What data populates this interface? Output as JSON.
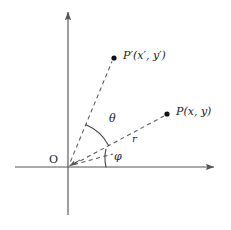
{
  "figure": {
    "type": "geometry-diagram",
    "background_color": "#ffffff",
    "stroke_color": "#555555",
    "text_color": "#1b1b1b",
    "width": 231,
    "height": 230
  },
  "axes": {
    "origin": {
      "x": 68,
      "y": 167,
      "label": "O"
    },
    "x_axis": {
      "name": "horizontal-axis",
      "from_x": 15,
      "to_x": 219,
      "y": 167,
      "arrow": "right"
    },
    "y_axis": {
      "name": "vertical-axis",
      "x": 68,
      "from_y": 215,
      "to_y": 7,
      "arrow": "up"
    }
  },
  "points": [
    {
      "id": "p-prime",
      "dot_x": 114,
      "dot_y": 58,
      "label": "P′(x′, y′)",
      "label_x": 124,
      "label_y": 51,
      "name": "point-p-prime"
    },
    {
      "id": "p",
      "dot_x": 167,
      "dot_y": 114,
      "label": "P(x, y)",
      "label_x": 177,
      "label_y": 107,
      "name": "point-p"
    }
  ],
  "rays": [
    {
      "id": "ray-to-p-prime",
      "from": [
        68,
        167
      ],
      "to": [
        112,
        61
      ],
      "style": "dashed"
    },
    {
      "id": "ray-to-p",
      "from": [
        68,
        167
      ],
      "to": [
        164,
        116
      ],
      "style": "dashed"
    },
    {
      "id": "baseline-segment",
      "from": [
        68,
        167
      ],
      "to": [
        112,
        155
      ],
      "style": "dashed"
    }
  ],
  "angles": [
    {
      "id": "theta",
      "label": "θ",
      "label_x": 109,
      "label_y": 114,
      "radius": 46,
      "start_deg": 28,
      "end_deg": 67,
      "name": "angle-theta"
    },
    {
      "id": "phi",
      "label": "φ",
      "label_x": 114,
      "label_y": 152,
      "radius": 38,
      "start_deg": 0,
      "end_deg": 28,
      "name": "angle-phi"
    }
  ],
  "segment_labels": [
    {
      "id": "radius-r",
      "label": "r",
      "label_x": 133,
      "label_y": 135,
      "name": "label-radius-r"
    }
  ]
}
